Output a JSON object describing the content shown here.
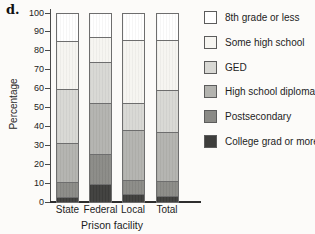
{
  "panel_label": "d.",
  "chart_data": {
    "type": "bar",
    "stacked": true,
    "title": "",
    "xlabel": "Prison facility",
    "ylabel": "Percentage",
    "ylim": [
      0,
      100
    ],
    "ytick_interval": 10,
    "grid": false,
    "legend_position": "right",
    "categories": [
      "State",
      "Federal",
      "Local",
      "Total"
    ],
    "series": [
      {
        "name": "College grad or more",
        "color": "#3e3e3c",
        "values": [
          2.5,
          9.5,
          4,
          3
        ]
      },
      {
        "name": "Postsecondary",
        "color": "#8a8a86",
        "values": [
          8,
          16,
          7.5,
          8
        ]
      },
      {
        "name": "High school diploma",
        "color": "#b3b3af",
        "values": [
          21,
          27,
          27,
          26
        ]
      },
      {
        "name": "GED",
        "color": "#d8d8d4",
        "values": [
          28.5,
          22,
          14,
          22.5
        ]
      },
      {
        "name": "Some high school",
        "color": "#f6f5f1",
        "values": [
          25.5,
          13.5,
          33.5,
          26.5
        ]
      },
      {
        "name": "8th grade or less",
        "color": "#ffffff",
        "values": [
          14.5,
          12,
          14,
          14
        ]
      }
    ],
    "legend_order": [
      "8th grade or less",
      "Some high school",
      "GED",
      "High school diploma",
      "Postsecondary",
      "College grad or more"
    ]
  },
  "colors": {
    "axis": "#4a4a4a",
    "segment_border": "#6e6e6e",
    "background": "#fcfbf9"
  }
}
